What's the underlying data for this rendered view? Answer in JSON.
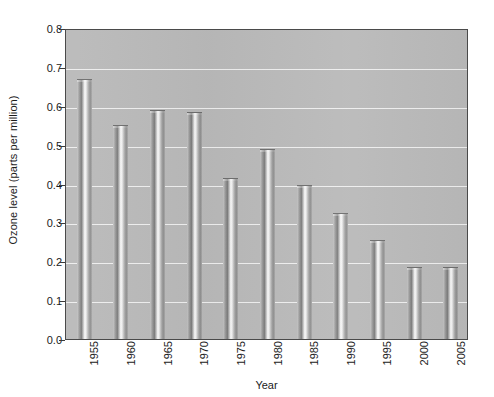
{
  "chart_data": {
    "type": "bar",
    "title": "",
    "xlabel": "Year",
    "ylabel": "Ozone level (parts per million)",
    "categories": [
      "1955",
      "1960",
      "1965",
      "1970",
      "1975",
      "1980",
      "1985",
      "1990",
      "1995",
      "2000",
      "2005"
    ],
    "values": [
      0.67,
      0.55,
      0.59,
      0.585,
      0.415,
      0.49,
      0.395,
      0.325,
      0.255,
      0.185,
      0.185
    ],
    "ylim": [
      0.0,
      0.8
    ],
    "ytick_labels": [
      "0.0",
      "0.1",
      "0.2",
      "0.3",
      "0.4",
      "0.5",
      "0.6",
      "0.7",
      "0.8"
    ],
    "ytick_values": [
      0.0,
      0.1,
      0.2,
      0.3,
      0.4,
      0.5,
      0.6,
      0.7,
      0.8
    ],
    "grid": "horizontal",
    "legend": "none",
    "colors": {
      "plot_background": "#b9b9b9",
      "gridline": "#f2f2f2",
      "bar_light": "#fafafa",
      "bar_dark": "#7e7e7e",
      "axis": "#4a4a4a",
      "text": "#1b1b1b",
      "page_background": "#ffffff"
    }
  }
}
